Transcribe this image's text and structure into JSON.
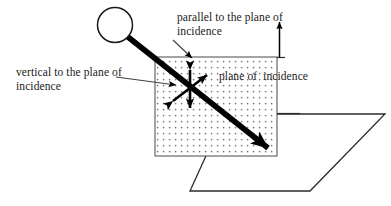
{
  "figure": {
    "background_color": "#ffffff",
    "stroke_color": "#000000",
    "stipple_color": "#8c8c8c",
    "labels": {
      "parallel": "parallel to the plane of\nincidence",
      "vertical": "vertical to the plane of\nincidence",
      "plane": "plane of  incidence"
    },
    "elements": {
      "source_circle": "light-source-circle",
      "incident_ray": "incident-ray-arrow",
      "stippled_square": "plane-of-incidence-square",
      "parallel_arrow": "parallel-polarization-arrow",
      "vertical_arrow": "vertical-polarization-arrow",
      "normal_arrow": "surface-normal-arrow",
      "surface": "reflecting-surface-parallelogram",
      "leader_parallel": "parallel-label-leader",
      "leader_vertical": "vertical-label-leader"
    }
  }
}
